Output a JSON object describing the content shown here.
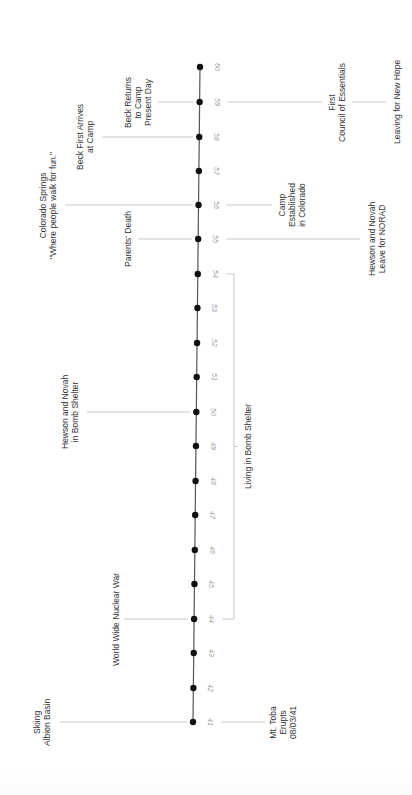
{
  "timeline": {
    "orientation": "vertical-rotated",
    "axis": {
      "top": {
        "x": 200,
        "y": 67
      },
      "bottom": {
        "x": 193,
        "y": 722
      },
      "color": "#555555"
    },
    "dot_color": "#111111",
    "connector_color": "#bbbbbb",
    "ticks": [
      {
        "label": "41",
        "y": 722
      },
      {
        "label": "42",
        "y": 688
      },
      {
        "label": "43",
        "y": 653
      },
      {
        "label": "44",
        "y": 619
      },
      {
        "label": "45",
        "y": 584
      },
      {
        "label": "46",
        "y": 550
      },
      {
        "label": "47",
        "y": 515
      },
      {
        "label": "48",
        "y": 481
      },
      {
        "label": "49",
        "y": 446
      },
      {
        "label": "50",
        "y": 412
      },
      {
        "label": "51",
        "y": 377
      },
      {
        "label": "52",
        "y": 343
      },
      {
        "label": "53",
        "y": 308
      },
      {
        "label": "54",
        "y": 274
      },
      {
        "label": "55",
        "y": 239
      },
      {
        "label": "56",
        "y": 205
      },
      {
        "label": "57",
        "y": 171
      },
      {
        "label": "58",
        "y": 137
      },
      {
        "label": "59",
        "y": 102
      },
      {
        "label": "60",
        "y": 67
      }
    ],
    "events_left": [
      {
        "text": "Skiing\nAlbion Basin",
        "y": 722,
        "line_x1": 60,
        "label_cx": 42
      },
      {
        "text": "World Wide Nuclear War",
        "y": 619,
        "line_x1": 124,
        "label_cx": 116
      },
      {
        "text": "Hewson and Novah\nin Bomb Shelter",
        "y": 412,
        "line_x1": 87,
        "label_cx": 70
      },
      {
        "text": "Parents' Death",
        "y": 239,
        "line_x1": 138,
        "label_cx": 128
      },
      {
        "text": "Colorado Springs\n\"Where people walk for fun.\"",
        "y": 205,
        "line_x1": 65,
        "label_cx": 48
      },
      {
        "text": "Beck First Arrives\nat Camp",
        "y": 137,
        "line_x1": 102,
        "label_cx": 85
      },
      {
        "text": "Beck Returns\nto Camp\nPresent Day",
        "y": 102,
        "line_x1": 158,
        "label_cx": 138
      }
    ],
    "events_right": [
      {
        "text": "Mt. Toba\nErupts\n08/03/41",
        "y": 722,
        "line_x2": 265,
        "label_cx": 283
      },
      {
        "text": "Camp\nEstablished\nin Colorado",
        "y": 205,
        "line_x2": 272,
        "label_cx": 292
      },
      {
        "text": "Hewson and Novah\nLeave for NORAD",
        "y": 239,
        "line_x2": 360,
        "label_cx": 377
      },
      {
        "text": "First\nCouncil of Essentials",
        "y": 102,
        "line_x2": 322,
        "label_cx": 337
      },
      {
        "text": "Leaving for New Hope",
        "y": 102,
        "line_x1": 352,
        "line_x2": 386,
        "label_cx": 397
      }
    ],
    "span": {
      "text": "Living in Bomb Shelter",
      "from_y": 274,
      "to_y": 619,
      "bracket_x": 234,
      "label_cx": 248
    }
  }
}
